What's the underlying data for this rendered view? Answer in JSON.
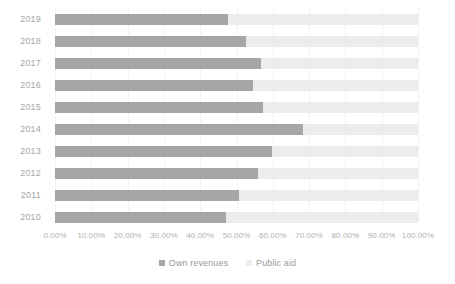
{
  "chart_data": {
    "type": "bar",
    "orientation": "horizontal",
    "stacked": true,
    "stacked_normalized": true,
    "title": "",
    "subtitle": "",
    "xlabel": "",
    "ylabel": "",
    "categories": [
      "2019",
      "2018",
      "2017",
      "2016",
      "2015",
      "2014",
      "2013",
      "2012",
      "2011",
      "2010"
    ],
    "series": [
      {
        "name": "Own revenues",
        "color": "#a6a6a6",
        "values": [
          47.7,
          52.6,
          56.7,
          54.5,
          57.3,
          68.3,
          59.8,
          55.9,
          50.7,
          47.1
        ]
      },
      {
        "name": "Public aid",
        "color": "#ececec",
        "values": [
          52.3,
          47.4,
          43.3,
          45.5,
          42.7,
          31.7,
          40.2,
          44.1,
          49.3,
          52.9
        ]
      }
    ],
    "xlim": [
      0,
      100
    ],
    "x_tick_values": [
      0,
      10,
      20,
      30,
      40,
      50,
      60,
      70,
      80,
      90,
      100
    ],
    "x_tick_labels": [
      "0.00%",
      "10.00%",
      "20.00%",
      "30.00%",
      "40.00%",
      "50.00%",
      "60.00%",
      "70.00%",
      "80.00%",
      "90.00%",
      "100.00%"
    ],
    "grid": true,
    "grid_axis": "x",
    "legend_position": "bottom",
    "legend": [
      {
        "label": "Own revenues",
        "color": "#a6a6a6",
        "marker": "square-marker"
      },
      {
        "label": "Public aid",
        "color": "#ececec",
        "marker": "square-marker"
      }
    ]
  },
  "colors": {
    "background": "#ffffff",
    "own_revenues": "#a6a6a6",
    "public_aid": "#ececec",
    "gridline": "#f2f2f2",
    "axis_text": "#a6a6a6",
    "legend_text": "#9a9a9a"
  }
}
